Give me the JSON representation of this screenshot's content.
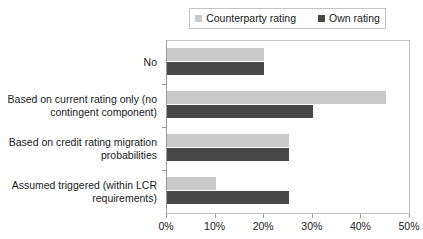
{
  "chart_data": {
    "type": "bar",
    "orientation": "horizontal",
    "title": "",
    "xlabel": "",
    "ylabel": "",
    "xlim": [
      0,
      50
    ],
    "xtick_labels": [
      "0%",
      "10%",
      "20%",
      "30%",
      "40%",
      "50%"
    ],
    "xtick_values": [
      0,
      10,
      20,
      30,
      40,
      50
    ],
    "grid": false,
    "legend_position": "top-right",
    "categories": [
      "No",
      "Based on current rating only (no\ncontingent component)",
      "Based on credit rating migration\nprobabilities",
      "Assumed triggered (within LCR\nrequirements)"
    ],
    "series": [
      {
        "name": "Counterparty rating",
        "color": "#c9c9c9",
        "values": [
          20,
          45,
          25,
          10
        ]
      },
      {
        "name": "Own rating",
        "color": "#484848",
        "values": [
          20,
          30,
          25,
          25
        ]
      }
    ]
  },
  "legend": {
    "entries": [
      {
        "label": "Counterparty rating",
        "swatch": "#c9c9c9"
      },
      {
        "label": "Own rating",
        "swatch": "#484848"
      }
    ]
  }
}
